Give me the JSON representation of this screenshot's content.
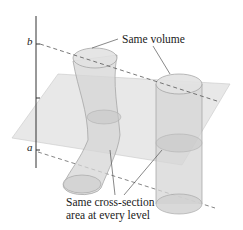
{
  "diagram": {
    "type": "geometry-illustration",
    "axis": {
      "labels": {
        "top": "b",
        "bottom": "a"
      }
    },
    "annotations": {
      "volume": "Same volume",
      "cross_section_line1": "Same cross-section",
      "cross_section_line2": "area at every level"
    },
    "solids": [
      {
        "name": "slanted-curved-cylinder",
        "shape": "curved cylinder"
      },
      {
        "name": "right-circular-cylinder",
        "shape": "straight cylinder"
      }
    ],
    "plane": {
      "name": "cutting-plane",
      "description": "Horizontal plane slicing both solids"
    },
    "colors": {
      "solid_fill": "#d9d9d9",
      "solid_stroke": "#9a9a9a",
      "plane_fill": "#e6e6e6",
      "axis": "#333333",
      "dash": "#555555",
      "text": "#1a1a1a"
    }
  }
}
